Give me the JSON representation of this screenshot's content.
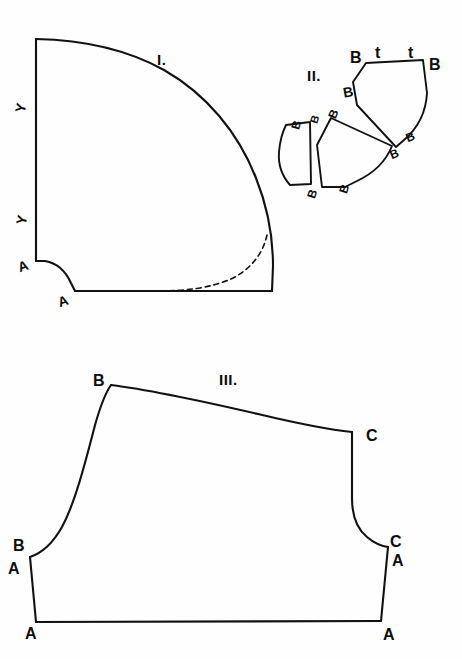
{
  "page": {
    "kind": "scanned-line-drawing",
    "background_color": "#fefefe",
    "ink_color": "#111111",
    "width": 462,
    "height": 659
  },
  "figures": [
    {
      "id": "figure-1",
      "caption": "I.",
      "caption_pos": {
        "x": 157,
        "y": 52
      },
      "description": "quarter-dome pattern piece with seam notches",
      "labels": [
        {
          "text": "Y",
          "x": 16,
          "y": 101,
          "rotate": -78,
          "size": "sz-mid"
        },
        {
          "text": "Y",
          "x": 17,
          "y": 213,
          "rotate": -78,
          "size": "sz-mid"
        },
        {
          "text": "A",
          "x": 18,
          "y": 259,
          "rotate": -18,
          "size": "sz-mid"
        },
        {
          "text": "A",
          "x": 58,
          "y": 294,
          "rotate": -18,
          "size": "sz-mid"
        }
      ]
    },
    {
      "id": "figure-2",
      "caption": "II.",
      "caption_pos": {
        "x": 307,
        "y": 68
      },
      "description": "three gore / gusset pieces with B and t seam marks",
      "labels": [
        {
          "text": "B",
          "x": 350,
          "y": 50,
          "rotate": 0,
          "size": "sz-big"
        },
        {
          "text": "t",
          "x": 375,
          "y": 45,
          "rotate": 0,
          "size": "sz-big"
        },
        {
          "text": "t",
          "x": 408,
          "y": 45,
          "rotate": 0,
          "size": "sz-big"
        },
        {
          "text": "B",
          "x": 429,
          "y": 57,
          "rotate": 0,
          "size": "sz-big"
        },
        {
          "text": "B",
          "x": 343,
          "y": 85,
          "rotate": -10,
          "size": "sz-mid"
        },
        {
          "text": "B",
          "x": 329,
          "y": 108,
          "rotate": -68,
          "size": "sz-sm"
        },
        {
          "text": "B",
          "x": 311,
          "y": 114,
          "rotate": -72,
          "size": "sz-xs"
        },
        {
          "text": "B",
          "x": 292,
          "y": 119,
          "rotate": -75,
          "size": "sz-sm"
        },
        {
          "text": "B",
          "x": 406,
          "y": 131,
          "rotate": -22,
          "size": "sz-sm"
        },
        {
          "text": "B",
          "x": 390,
          "y": 148,
          "rotate": -22,
          "size": "sz-sm"
        },
        {
          "text": "B",
          "x": 340,
          "y": 183,
          "rotate": -72,
          "size": "sz-sm"
        },
        {
          "text": "B",
          "x": 308,
          "y": 188,
          "rotate": -72,
          "size": "sz-sm"
        }
      ]
    },
    {
      "id": "figure-3",
      "caption": "III.",
      "caption_pos": {
        "x": 219,
        "y": 372
      },
      "description": "bodice / band pattern piece with A, B, C registration points",
      "labels": [
        {
          "text": "B",
          "x": 93,
          "y": 373,
          "rotate": 0,
          "size": "sz-big"
        },
        {
          "text": "C",
          "x": 366,
          "y": 428,
          "rotate": 0,
          "size": "sz-big"
        },
        {
          "text": "B",
          "x": 13,
          "y": 538,
          "rotate": 0,
          "size": "sz-big"
        },
        {
          "text": "A",
          "x": 8,
          "y": 561,
          "rotate": 0,
          "size": "sz-big"
        },
        {
          "text": "C",
          "x": 390,
          "y": 534,
          "rotate": 0,
          "size": "sz-big"
        },
        {
          "text": "A",
          "x": 392,
          "y": 553,
          "rotate": 0,
          "size": "sz-big"
        },
        {
          "text": "A",
          "x": 25,
          "y": 626,
          "rotate": 0,
          "size": "sz-big"
        },
        {
          "text": "A",
          "x": 383,
          "y": 627,
          "rotate": 0,
          "size": "sz-big"
        }
      ]
    }
  ],
  "paths": {
    "fig1_outline": "M 36 38 L 36 262 L 44 262 C 56 264 64 272 70 283 L 74 292 L 272 292 L 272 266 C 272 230 268 190 252 148 C 234 102 196 66 150 50 C 114 40 72 37 36 38 Z",
    "fig1_dash": "M 266 236 C 262 256 248 272 228 280 C 208 288 186 291 160 292",
    "fig2_top": "M 366 62 L 423 59 L 427 92 C 425 110 418 126 404 139 L 396 146 L 357 104 L 353 81 Z",
    "fig2_mid": "M 330 118 L 338 122 L 392 146 C 386 160 374 172 358 180 L 345 186 L 322 186 L 317 144 Z",
    "fig2_left": "M 285 124 L 309 122 L 311 183 L 290 184 C 282 176 278 165 279 152 C 280 140 282 131 285 124 Z",
    "fig3_outline": "M 110 384 C 140 386 180 394 230 406 C 280 418 320 428 352 432 L 352 440 C 352 470 352 492 352 508 C 352 522 356 532 366 540 L 388 546 L 392 548 L 382 622 L 36 622 L 30 556 L 40 552 C 52 546 62 534 72 514 C 84 488 94 448 110 384 Z"
  },
  "stroke_widths": {
    "thick": 2.1,
    "medium": 1.9,
    "dashed": 1.6
  }
}
